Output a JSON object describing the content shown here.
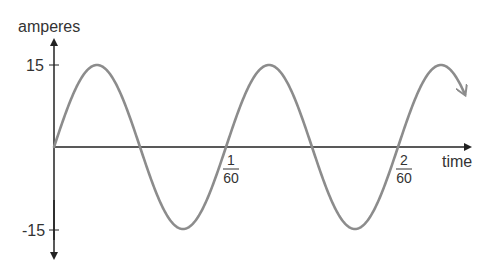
{
  "chart_data": {
    "type": "line",
    "title": "",
    "xlabel": "time",
    "ylabel": "amperes",
    "series": [
      {
        "name": "current",
        "function": "15*sin(120*pi*t)",
        "amplitude": 15,
        "frequency_hz": 60,
        "x": [
          0,
          0.004167,
          0.008333,
          0.0125,
          0.016667,
          0.020833,
          0.025,
          0.029167,
          0.033333,
          0.0375
        ],
        "values": [
          0,
          15,
          0,
          -15,
          0,
          15,
          0,
          -15,
          0,
          15
        ]
      }
    ],
    "y_ticks": [
      {
        "value": 15,
        "label": "15"
      },
      {
        "value": -15,
        "label": "-15"
      }
    ],
    "x_ticks": [
      {
        "value": 0.016667,
        "numerator": "1",
        "denominator": "60"
      },
      {
        "value": 0.033333,
        "numerator": "2",
        "denominator": "60"
      }
    ],
    "ylim": [
      -15,
      15
    ],
    "xlim": [
      0,
      0.0375
    ],
    "grid": false,
    "legend": false,
    "line_color": "#8c8c8c",
    "axis_color": "#222222"
  },
  "labels": {
    "y_axis": "amperes",
    "x_axis": "time",
    "y_tick_top": "15",
    "y_tick_bottom": "-15",
    "x_tick1_num": "1",
    "x_tick1_den": "60",
    "x_tick2_num": "2",
    "x_tick2_den": "60"
  }
}
